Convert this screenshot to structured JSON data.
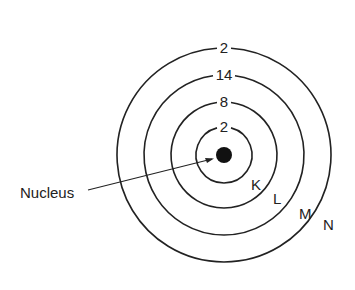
{
  "diagram": {
    "nucleus_label": "Nucleus",
    "center": [
      224,
      155
    ],
    "shells": [
      {
        "name": "K",
        "electrons": "2",
        "radius": 28,
        "name_pos": [
          251,
          190
        ]
      },
      {
        "name": "L",
        "electrons": "8",
        "radius": 53,
        "name_pos": [
          273,
          204
        ]
      },
      {
        "name": "M",
        "electrons": "14",
        "radius": 80,
        "name_pos": [
          299,
          219
        ]
      },
      {
        "name": "N",
        "electrons": "2",
        "radius": 107,
        "name_pos": [
          323,
          230
        ]
      }
    ],
    "colors": {
      "line": "#222222",
      "nucleus": "#111111"
    }
  }
}
